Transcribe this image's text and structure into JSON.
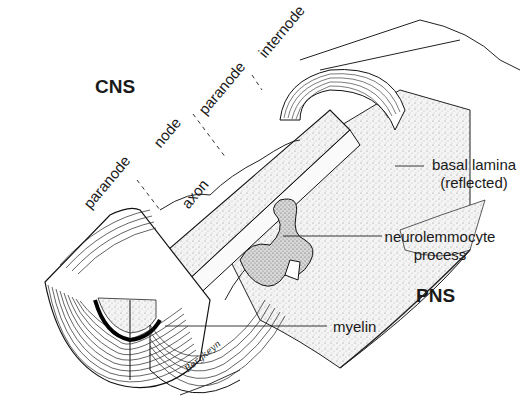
{
  "figure": {
    "regions": {
      "cns": "CNS",
      "pns": "PNS"
    },
    "segment_labels": {
      "paranode_left": "paranode",
      "node": "node",
      "paranode_right": "paranode",
      "internode": "internode"
    },
    "structure_labels": {
      "axon": "axon",
      "basal_lamina_line1": "basal lamina",
      "basal_lamina_line2": "(reflected)",
      "neurolemmocyte_line1": "neurolemmocyte",
      "neurolemmocyte_line2": "process",
      "myelin": "myelin"
    },
    "signature": "Bergkeyn",
    "colors": {
      "ink": "#1a1a1a",
      "background": "#ffffff",
      "stipple": "#e9e9e9"
    }
  }
}
